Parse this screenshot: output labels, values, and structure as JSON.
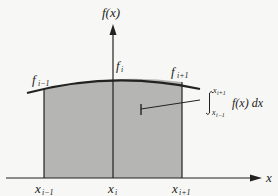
{
  "diagram": {
    "type": "integral-area",
    "y_axis_label": "f(x)",
    "x_axis_label": "x",
    "curve_labels": [
      {
        "base": "f",
        "sub": "i−1"
      },
      {
        "base": "f",
        "sub": "i"
      },
      {
        "base": "f",
        "sub": "i+1"
      }
    ],
    "x_ticks": [
      {
        "base": "x",
        "sub": "i−1"
      },
      {
        "base": "x",
        "sub": "i"
      },
      {
        "base": "x",
        "sub": "i+1"
      }
    ],
    "integral": {
      "upper": "x",
      "upper_sub": "i+1",
      "lower": "x",
      "lower_sub": "i−1",
      "integrand": "f(x) dx"
    },
    "colors": {
      "shade": "#b5b5b3",
      "line": "#222222",
      "background": "#f7f7f5"
    }
  }
}
